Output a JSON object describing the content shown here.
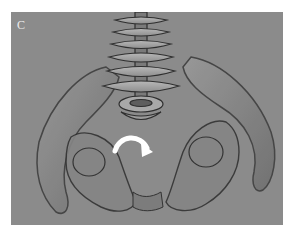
{
  "figure": {
    "panel_label": "C",
    "background_color": "#8b8b8b",
    "annotation": {
      "type": "curved-arrow",
      "direction": "clockwise rotation",
      "color": "#ffffff"
    }
  }
}
